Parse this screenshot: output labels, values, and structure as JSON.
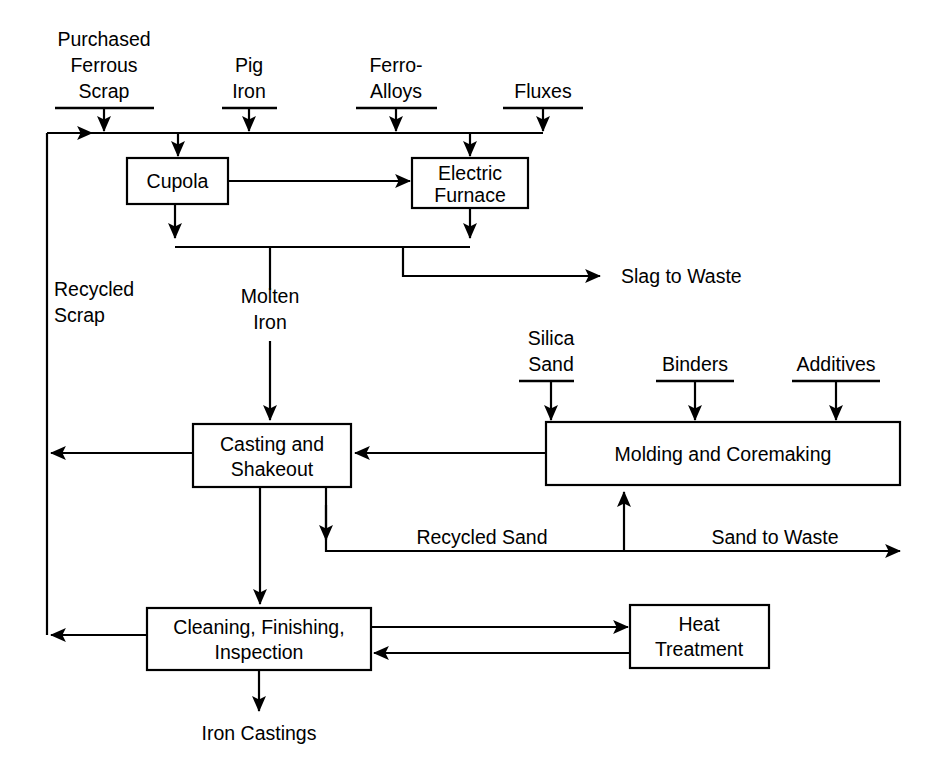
{
  "diagram": {
    "type": "process-flow",
    "line_color": "#000000",
    "background_color": "#ffffff"
  },
  "inputs_top": [
    {
      "id": "purchased-ferrous-scrap",
      "lines": [
        "Purchased",
        "Ferrous",
        "Scrap"
      ]
    },
    {
      "id": "pig-iron",
      "lines": [
        "Pig",
        "Iron"
      ]
    },
    {
      "id": "ferro-alloys",
      "lines": [
        "Ferro-",
        "Alloys"
      ]
    },
    {
      "id": "fluxes",
      "lines": [
        "Fluxes"
      ]
    }
  ],
  "inputs_mid": [
    {
      "id": "silica-sand",
      "lines": [
        "Silica",
        "Sand"
      ]
    },
    {
      "id": "binders",
      "lines": [
        "Binders"
      ]
    },
    {
      "id": "additives",
      "lines": [
        "Additives"
      ]
    }
  ],
  "boxes": [
    {
      "id": "cupola",
      "lines": [
        "Cupola"
      ]
    },
    {
      "id": "electric-furnace",
      "lines": [
        "Electric",
        "Furnace"
      ]
    },
    {
      "id": "casting-and-shakeout",
      "lines": [
        "Casting and",
        "Shakeout"
      ]
    },
    {
      "id": "molding-and-coremaking",
      "lines": [
        "Molding and Coremaking"
      ]
    },
    {
      "id": "cleaning-finishing-inspection",
      "lines": [
        "Cleaning, Finishing,",
        "Inspection"
      ]
    },
    {
      "id": "heat-treatment",
      "lines": [
        "Heat",
        "Treatment"
      ]
    }
  ],
  "flow_labels": [
    {
      "id": "recycled-scrap",
      "lines": [
        "Recycled",
        "Scrap"
      ]
    },
    {
      "id": "molten-iron",
      "lines": [
        "Molten",
        "Iron"
      ]
    },
    {
      "id": "slag-to-waste",
      "lines": [
        "Slag to Waste"
      ]
    },
    {
      "id": "recycled-sand",
      "lines": [
        "Recycled Sand"
      ]
    },
    {
      "id": "sand-to-waste",
      "lines": [
        "Sand to Waste"
      ]
    },
    {
      "id": "iron-castings",
      "lines": [
        "Iron Castings"
      ]
    }
  ],
  "text": {
    "purchased": "Purchased",
    "ferrous": "Ferrous",
    "scrap": "Scrap",
    "pig": "Pig",
    "iron": "Iron",
    "ferro": "Ferro-",
    "alloys": "Alloys",
    "fluxes": "Fluxes",
    "cupola": "Cupola",
    "electric": "Electric",
    "furnace": "Furnace",
    "slag_to_waste": "Slag to Waste",
    "recycled": "Recycled",
    "scrap2": "Scrap",
    "molten": "Molten",
    "iron2": "Iron",
    "silica": "Silica",
    "sand": "Sand",
    "binders": "Binders",
    "additives": "Additives",
    "casting_and": "Casting and",
    "shakeout": "Shakeout",
    "molding_and_coremaking": "Molding and Coremaking",
    "recycled_sand": "Recycled Sand",
    "sand_to_waste": "Sand to Waste",
    "cleaning_finishing": "Cleaning, Finishing,",
    "inspection": "Inspection",
    "heat": "Heat",
    "treatment": "Treatment",
    "iron_castings": "Iron Castings"
  }
}
